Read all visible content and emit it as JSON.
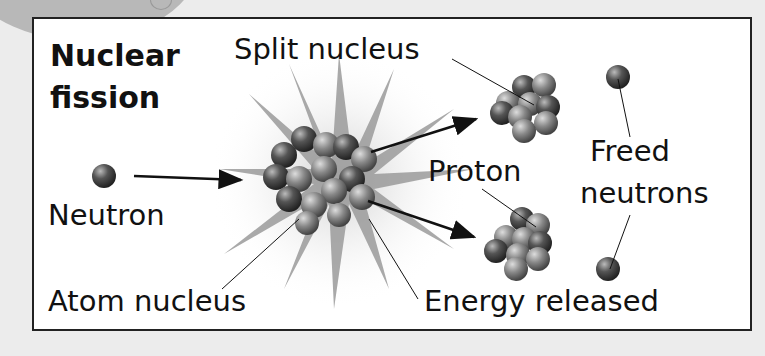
{
  "title": {
    "line1": "Nuclear",
    "line2": "fission"
  },
  "labels": {
    "split_nucleus": "Split nucleus",
    "freed_neutrons_1": "Freed",
    "freed_neutrons_2": "neutrons",
    "proton": "Proton",
    "neutron": "Neutron",
    "atom_nucleus": "Atom nucleus",
    "energy_released": "Energy released"
  },
  "colors": {
    "background": "#ececec",
    "panel": "#ffffff",
    "border": "#222222",
    "burst": "#9a9a9a"
  }
}
